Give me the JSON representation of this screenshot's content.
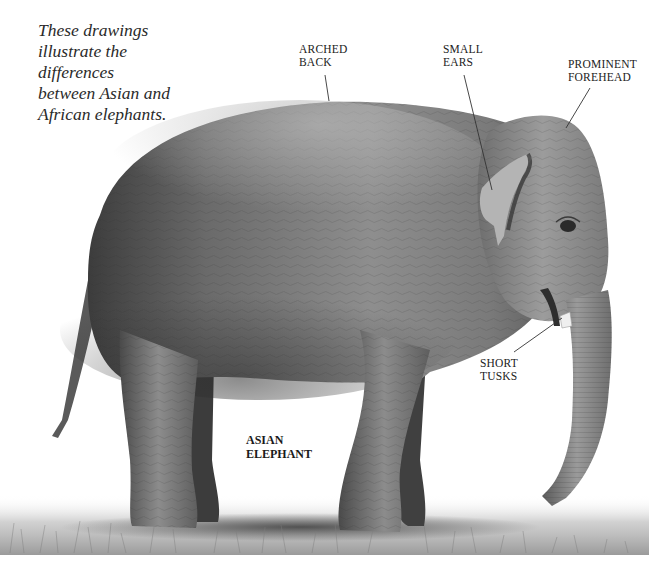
{
  "intro": {
    "lines": [
      "These drawings",
      "illustrate the",
      "differences",
      "between Asian and",
      "African elephants."
    ]
  },
  "callouts": [
    {
      "id": "arched-back",
      "lines": [
        "ARCHED",
        "BACK"
      ]
    },
    {
      "id": "small-ears",
      "lines": [
        "SMALL",
        "EARS"
      ]
    },
    {
      "id": "prominent-forehead",
      "lines": [
        "PROMINENT",
        "FOREHEAD"
      ]
    },
    {
      "id": "short-tusks",
      "lines": [
        "SHORT",
        "TUSKS"
      ]
    }
  ],
  "species_label": {
    "lines": [
      "ASIAN",
      "ELEPHANT"
    ]
  },
  "colors": {
    "background": "#ffffff",
    "text": "#222222",
    "leader_line": "#333333",
    "elephant_dark": "#3a3a3a",
    "elephant_mid": "#8a8a8a",
    "elephant_light": "#c4c4c4",
    "grass": "#9a9a9a"
  }
}
